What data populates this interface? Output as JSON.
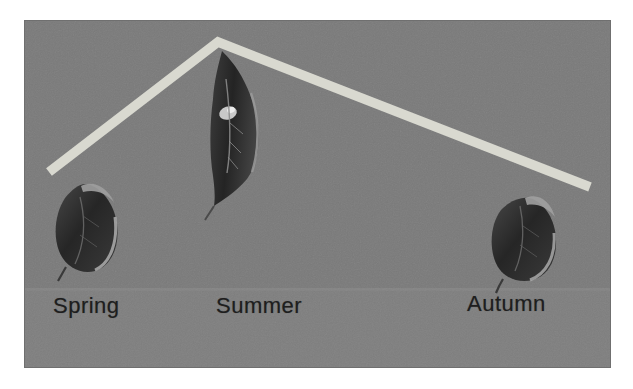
{
  "figure": {
    "panel_bg_color": "#7a7a7a",
    "line_color": "#d9d9d0",
    "text_color": "#1e1e1e",
    "seasons": [
      {
        "label": "Spring",
        "icon": "spring-leaf-image"
      },
      {
        "label": "Summer",
        "icon": "summer-leaf-image"
      },
      {
        "label": "Autumn",
        "icon": "autumn-leaf-image"
      }
    ]
  },
  "diagram": {
    "type": "peak-line",
    "categories": [
      "Spring",
      "Summer",
      "Autumn"
    ],
    "peak_over": "Summer",
    "shape": "line rises from above Spring to a peak above Summer, then falls toward Autumn"
  }
}
